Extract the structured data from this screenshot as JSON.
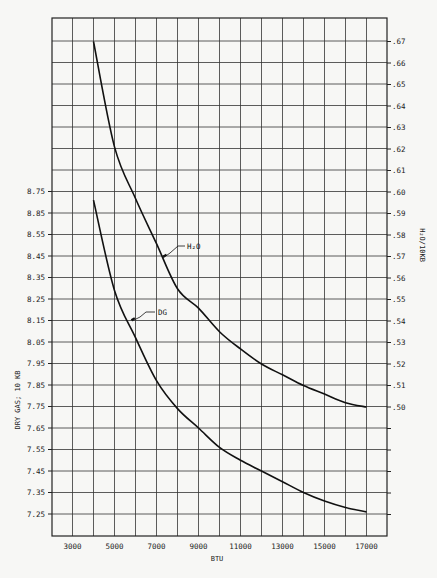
{
  "chart_data": {
    "type": "line",
    "title": "",
    "xlabel": "BTU",
    "ylabel": "DRY GAS; 10 KB",
    "y2label": "H2O/10KB",
    "xlim": [
      2000,
      18000
    ],
    "ylim": [
      7.15,
      9.55
    ],
    "y2lim": [
      0.4785,
      0.6785
    ],
    "grid": true,
    "legend": "inline-labels",
    "x_ticks": [
      3000,
      5000,
      7000,
      9000,
      11000,
      13000,
      15000,
      17000
    ],
    "x_tick_labels": [
      "3000",
      "5000",
      "7000",
      "9000",
      "11000",
      "13000",
      "15000",
      "17000"
    ],
    "y_ticks": [
      8.75,
      8.65,
      8.55,
      8.45,
      8.35,
      8.25,
      8.15,
      8.05,
      7.95,
      7.85,
      7.75,
      7.65,
      7.55,
      7.45,
      7.35,
      7.25
    ],
    "y_tick_labels": [
      "8.75",
      "8.85",
      "8.55",
      "8.45",
      "8.35",
      "8.25",
      "8.15",
      "8.05",
      "7.95",
      "7.85",
      "7.75",
      "7.65",
      "7.55",
      "7.45",
      "7.35",
      "7.25"
    ],
    "y2_ticks": [
      0.67,
      0.66,
      0.65,
      0.64,
      0.63,
      0.62,
      0.61,
      0.6,
      0.59,
      0.58,
      0.57,
      0.56,
      0.55,
      0.54,
      0.53,
      0.52,
      0.51,
      0.5
    ],
    "y2_tick_labels": [
      ".67",
      ".66",
      ".65",
      ".64",
      ".63",
      ".62",
      ".61",
      ".60",
      ".59",
      ".58",
      ".57",
      ".56",
      ".55",
      ".54",
      ".53",
      ".52",
      ".51",
      ".50"
    ],
    "x": [
      4000,
      5000,
      6000,
      7000,
      8000,
      9000,
      10000,
      11000,
      12000,
      13000,
      14000,
      15000,
      16000,
      17000
    ],
    "series": [
      {
        "name": "H2O",
        "label": "H₂O",
        "axis": "right",
        "values": [
          0.67,
          0.621,
          0.597,
          0.576,
          0.555,
          0.546,
          0.535,
          0.527,
          0.52,
          0.515,
          0.51,
          0.506,
          0.502,
          0.5
        ]
      },
      {
        "name": "DG",
        "label": "DG",
        "axis": "left",
        "values": [
          8.71,
          8.29,
          8.07,
          7.87,
          7.74,
          7.65,
          7.56,
          7.5,
          7.45,
          7.4,
          7.35,
          7.31,
          7.28,
          7.26
        ]
      }
    ]
  },
  "labels": {
    "x_axis_title": "BTU",
    "y_axis_title": "DRY GAS; 10 KB",
    "y2_axis_title": "H₂O/10KB",
    "h2o_curve_label": "H₂O",
    "dg_curve_label": "DG"
  }
}
